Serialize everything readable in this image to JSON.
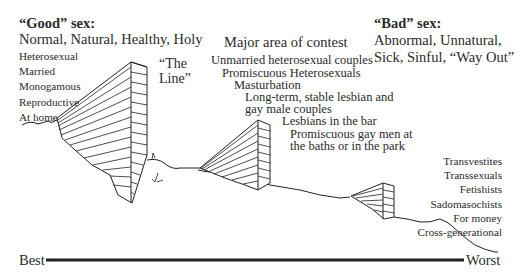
{
  "good": {
    "title": "“Good” sex:",
    "subtitle": "Normal, Natural, Healthy, Holy",
    "items": [
      "Heterosexual",
      "Married",
      "Monogamous",
      "Reproductive",
      "At home"
    ]
  },
  "line_label": [
    "“The",
    "Line”"
  ],
  "contest": {
    "title": "Major area of contest",
    "items": [
      "Unmarried heterosexual couples",
      "Promiscuous Heterosexuals",
      "Masturbation",
      "Long-term, stable lesbian and",
      "gay male couples",
      "Lesbians in the bar",
      "Promiscuous gay men at",
      "the baths or in the park"
    ]
  },
  "bad": {
    "title": "“Bad” sex:",
    "subtitle_lines": [
      "Abnormal, Unnatural,",
      "Sick, Sinful, “Way Out”"
    ],
    "items": [
      "Transvestites",
      "Transsexuals",
      "Fetishists",
      "Sadomasochists",
      "For money",
      "Cross-generational"
    ]
  },
  "scale": {
    "left": "Best",
    "right": "Worst"
  }
}
